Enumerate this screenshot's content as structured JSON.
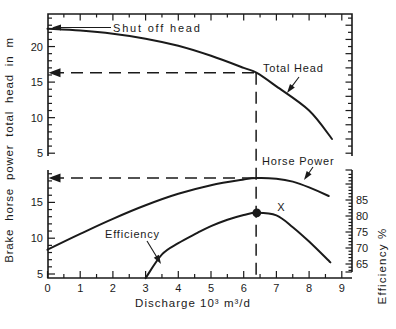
{
  "figure": {
    "y_axis_left_label": "Brake horse power total head in m",
    "y_axis_right_label": "Efficiency %",
    "x_axis_label": "Discharge 10³ m³/d"
  },
  "labels": {
    "shut_off_head": "Shut off head",
    "total_head": "Total Head",
    "horse_power": "Horse Power",
    "efficiency": "Efficiency",
    "x_marker": "X"
  },
  "colors": {
    "ink": "#1a1a1a",
    "background": "#ffffff"
  },
  "chart_data": {
    "type": "line",
    "xlabel": "Discharge 10³ m³/d",
    "ylabel_left": "Brake horse power total head in m",
    "ylabel_right": "Efficiency %",
    "x_axis": {
      "ticks": [
        0,
        1,
        2,
        3,
        4,
        5,
        6,
        7,
        8,
        9
      ],
      "minor_step": 0.5,
      "range": [
        0,
        9.3
      ]
    },
    "panels": {
      "top": {
        "scale": "head_m",
        "ticks": [
          5,
          10,
          15,
          20
        ],
        "range": [
          4.5,
          24.6
        ],
        "grid": false
      },
      "bottom_left": {
        "scale": "brake_horse_power",
        "ticks": [
          5,
          10,
          15
        ],
        "range": [
          4.4,
          19.5
        ],
        "grid": false
      },
      "bottom_right": {
        "scale": "efficiency_pct",
        "ticks": [
          65,
          70,
          75,
          80,
          85
        ],
        "range": [
          62,
          94
        ],
        "grid": false
      }
    },
    "series": [
      {
        "name": "Total Head",
        "scale": "head_m",
        "annotation": "Total Head",
        "shut_off_head_m": 22.5,
        "points": [
          [
            0,
            22.5
          ],
          [
            1,
            22.25
          ],
          [
            2,
            21.8
          ],
          [
            3,
            21.1
          ],
          [
            4,
            20.1
          ],
          [
            5,
            18.7
          ],
          [
            6,
            17.0
          ],
          [
            6.4,
            16.3
          ],
          [
            7,
            14.4
          ],
          [
            8,
            11.0
          ],
          [
            8.7,
            7.0
          ]
        ]
      },
      {
        "name": "Horse Power",
        "scale": "brake_horse_power",
        "annotation": "Horse Power",
        "points": [
          [
            0,
            8.4
          ],
          [
            1,
            10.6
          ],
          [
            2,
            12.7
          ],
          [
            3,
            14.6
          ],
          [
            4,
            16.2
          ],
          [
            5,
            17.4
          ],
          [
            6,
            18.2
          ],
          [
            6.4,
            18.4
          ],
          [
            7,
            18.3
          ],
          [
            7.5,
            17.9
          ],
          [
            8,
            17.1
          ],
          [
            8.6,
            15.9
          ]
        ]
      },
      {
        "name": "Efficiency",
        "scale": "efficiency_pct",
        "annotation": "Efficiency",
        "points": [
          [
            3,
            60.6
          ],
          [
            3.5,
            68
          ],
          [
            4,
            71.5
          ],
          [
            4.6,
            74.8
          ],
          [
            5,
            76.8
          ],
          [
            5.5,
            78.8
          ],
          [
            6,
            80.3
          ],
          [
            6.4,
            81
          ],
          [
            7,
            80.2
          ],
          [
            7.5,
            76.5
          ],
          [
            8,
            72
          ],
          [
            8.65,
            65.5
          ]
        ]
      }
    ],
    "guides": {
      "total_head_guide_m": 16.3,
      "horse_power_guide": 18.4,
      "discharge_guide": 6.38,
      "style": "dashed-with-left-arrowheads"
    },
    "operating_point": {
      "discharge": 6.4,
      "efficiency_pct": 81,
      "marker": "filled-dot",
      "marker_label": "X"
    },
    "legend": "inline-annotations"
  }
}
